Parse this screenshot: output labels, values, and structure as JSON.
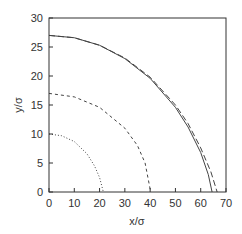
{
  "chart_data": {
    "type": "line",
    "title": "",
    "xlabel": "x/σ",
    "ylabel": "y/σ",
    "xlim": [
      0,
      70
    ],
    "ylim": [
      0,
      30
    ],
    "xticks": [
      0,
      10,
      20,
      30,
      40,
      50,
      60,
      70
    ],
    "yticks": [
      0,
      5,
      10,
      15,
      20,
      25,
      30
    ],
    "grid": false,
    "legend": null,
    "series": [
      {
        "name": "solid",
        "style": "solid",
        "points": [
          [
            0,
            27
          ],
          [
            10,
            26.6
          ],
          [
            20,
            25.3
          ],
          [
            30,
            23
          ],
          [
            40,
            19.6
          ],
          [
            50,
            14.6
          ],
          [
            55,
            11.2
          ],
          [
            60,
            6.8
          ],
          [
            63,
            3
          ],
          [
            64.5,
            0
          ]
        ]
      },
      {
        "name": "long-dashed",
        "style": "dashed",
        "points": [
          [
            0,
            27
          ],
          [
            10,
            26.6
          ],
          [
            20,
            25.3
          ],
          [
            30,
            23.1
          ],
          [
            40,
            19.8
          ],
          [
            50,
            15
          ],
          [
            55,
            11.8
          ],
          [
            60,
            7.6
          ],
          [
            64,
            3.5
          ],
          [
            66.5,
            0
          ]
        ]
      },
      {
        "name": "short-dashed",
        "style": "short-dashed",
        "points": [
          [
            0,
            17
          ],
          [
            10,
            16.4
          ],
          [
            20,
            14.6
          ],
          [
            30,
            11
          ],
          [
            35,
            8
          ],
          [
            38,
            5
          ],
          [
            40,
            0.5
          ],
          [
            40.3,
            0
          ]
        ]
      },
      {
        "name": "dotted",
        "style": "dotted",
        "points": [
          [
            0,
            10
          ],
          [
            5,
            9.7
          ],
          [
            10,
            8.7
          ],
          [
            15,
            6.6
          ],
          [
            18,
            4.5
          ],
          [
            20,
            2.5
          ],
          [
            21.5,
            0
          ]
        ]
      }
    ]
  }
}
